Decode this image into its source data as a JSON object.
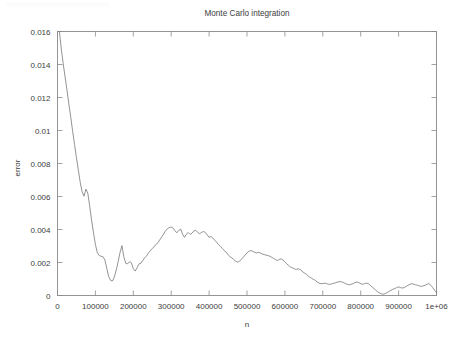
{
  "figure": {
    "background_color": "#ffffff",
    "frame_color": "#8a8a8a",
    "text_color": "#3d3d3d"
  },
  "chart_data": {
    "type": "line",
    "title": "Monte Carlo integration",
    "xlabel": "n",
    "ylabel": "error",
    "grid": false,
    "legend": false,
    "legend_position": "none",
    "line_color": "#808080",
    "xlim": [
      0,
      1000000
    ],
    "ylim": [
      0,
      0.016
    ],
    "xticks": [
      0,
      100000,
      200000,
      300000,
      400000,
      500000,
      600000,
      700000,
      800000,
      900000,
      1000000
    ],
    "xticklabels": [
      "0",
      "100000",
      "200000",
      "300000",
      "400000",
      "500000",
      "600000",
      "700000",
      "800000",
      "900000",
      "1e+06"
    ],
    "yticks": [
      0,
      0.002,
      0.004,
      0.006,
      0.008,
      0.01,
      0.012,
      0.014,
      0.016
    ],
    "yticklabels": [
      "0",
      "0.002",
      "0.004",
      "0.006",
      "0.008",
      "0.01",
      "0.012",
      "0.014",
      "0.016"
    ],
    "series": [
      {
        "name": "error",
        "x": [
          5000,
          10000,
          15000,
          20000,
          25000,
          30000,
          35000,
          40000,
          45000,
          50000,
          55000,
          60000,
          65000,
          70000,
          75000,
          80000,
          85000,
          90000,
          95000,
          100000,
          105000,
          110000,
          115000,
          120000,
          125000,
          130000,
          135000,
          140000,
          145000,
          150000,
          155000,
          160000,
          165000,
          170000,
          175000,
          180000,
          185000,
          190000,
          195000,
          200000,
          205000,
          210000,
          215000,
          220000,
          225000,
          230000,
          235000,
          240000,
          245000,
          250000,
          255000,
          260000,
          265000,
          270000,
          275000,
          280000,
          285000,
          290000,
          295000,
          300000,
          305000,
          310000,
          315000,
          320000,
          325000,
          330000,
          335000,
          340000,
          345000,
          350000,
          355000,
          360000,
          365000,
          370000,
          375000,
          380000,
          385000,
          390000,
          395000,
          400000,
          405000,
          410000,
          415000,
          420000,
          425000,
          430000,
          435000,
          440000,
          445000,
          450000,
          455000,
          460000,
          465000,
          470000,
          475000,
          480000,
          485000,
          490000,
          495000,
          500000,
          505000,
          510000,
          515000,
          520000,
          525000,
          530000,
          535000,
          540000,
          545000,
          550000,
          555000,
          560000,
          565000,
          570000,
          575000,
          580000,
          585000,
          590000,
          595000,
          600000,
          605000,
          610000,
          615000,
          620000,
          625000,
          630000,
          635000,
          640000,
          645000,
          650000,
          655000,
          660000,
          665000,
          670000,
          675000,
          680000,
          685000,
          690000,
          695000,
          700000,
          705000,
          710000,
          715000,
          720000,
          725000,
          730000,
          735000,
          740000,
          745000,
          750000,
          755000,
          760000,
          765000,
          770000,
          775000,
          780000,
          785000,
          790000,
          795000,
          800000,
          805000,
          810000,
          815000,
          820000,
          825000,
          830000,
          835000,
          840000,
          845000,
          850000,
          855000,
          860000,
          865000,
          870000,
          875000,
          880000,
          885000,
          890000,
          895000,
          900000,
          905000,
          910000,
          915000,
          920000,
          925000,
          930000,
          935000,
          940000,
          945000,
          950000,
          955000,
          960000,
          965000,
          970000,
          975000,
          980000,
          985000,
          990000,
          995000,
          1000000
        ],
        "y": [
          0.016,
          0.01495,
          0.01405,
          0.01325,
          0.01245,
          0.0116,
          0.0108,
          0.00995,
          0.00915,
          0.00835,
          0.0076,
          0.00685,
          0.00628,
          0.00602,
          0.00645,
          0.0062,
          0.0054,
          0.00455,
          0.0038,
          0.0031,
          0.0026,
          0.00242,
          0.00238,
          0.00235,
          0.00215,
          0.00165,
          0.00115,
          0.00092,
          0.00088,
          0.00112,
          0.00155,
          0.00205,
          0.0026,
          0.00302,
          0.00235,
          0.00195,
          0.00192,
          0.00205,
          0.00198,
          0.00162,
          0.00148,
          0.00168,
          0.00192,
          0.00195,
          0.00212,
          0.00228,
          0.0024,
          0.00258,
          0.00272,
          0.00285,
          0.00295,
          0.0031,
          0.0032,
          0.00338,
          0.00355,
          0.00372,
          0.00392,
          0.00405,
          0.00412,
          0.00415,
          0.00408,
          0.00392,
          0.0038,
          0.00395,
          0.00402,
          0.00372,
          0.00352,
          0.00372,
          0.00382,
          0.0037,
          0.00378,
          0.00392,
          0.00395,
          0.00382,
          0.00375,
          0.00382,
          0.00388,
          0.00382,
          0.00368,
          0.00352,
          0.00358,
          0.00348,
          0.00335,
          0.00322,
          0.00308,
          0.00298,
          0.00285,
          0.00272,
          0.00262,
          0.00248,
          0.00235,
          0.00228,
          0.00218,
          0.00208,
          0.00202,
          0.00208,
          0.00218,
          0.00232,
          0.00245,
          0.00258,
          0.00268,
          0.00272,
          0.00268,
          0.00262,
          0.00258,
          0.00262,
          0.00258,
          0.00252,
          0.00248,
          0.00245,
          0.00242,
          0.00238,
          0.00232,
          0.00225,
          0.00218,
          0.00212,
          0.00218,
          0.00222,
          0.00215,
          0.00205,
          0.00192,
          0.00182,
          0.00172,
          0.00168,
          0.00162,
          0.00158,
          0.00162,
          0.00158,
          0.00148,
          0.00138,
          0.00132,
          0.00122,
          0.00112,
          0.00105,
          0.00098,
          0.00092,
          0.00082,
          0.00075,
          0.00072,
          0.00072,
          0.00075,
          0.00072,
          0.00068,
          0.00068,
          0.00072,
          0.00075,
          0.00078,
          0.00082,
          0.00085,
          0.00082,
          0.00078,
          0.00072,
          0.00068,
          0.00065,
          0.00068,
          0.00072,
          0.00078,
          0.00082,
          0.00078,
          0.00072,
          0.00068,
          0.00072,
          0.00075,
          0.00072,
          0.00062,
          0.00052,
          0.00042,
          0.00032,
          0.00022,
          0.00015,
          0.0001,
          8e-05,
          0.00012,
          0.00018,
          0.00025,
          0.00032,
          0.00038,
          0.00042,
          0.00048,
          0.00052,
          0.00048,
          0.00045,
          0.00048,
          0.00055,
          0.00062,
          0.00068,
          0.00072,
          0.00068,
          0.00065,
          0.00062,
          0.00058,
          0.00055,
          0.00058,
          0.00062,
          0.00068,
          0.00072,
          0.00062,
          0.00048,
          0.00032,
          0.00018
        ]
      }
    ]
  }
}
